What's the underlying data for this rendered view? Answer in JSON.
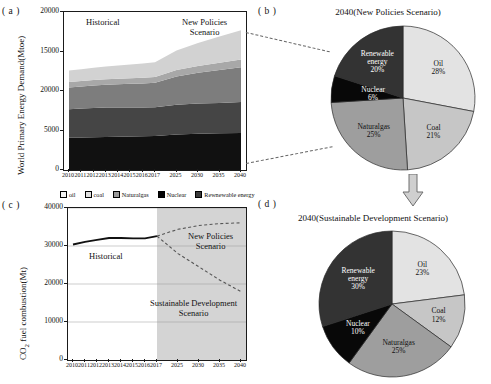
{
  "panels": {
    "a": {
      "label": "( a )"
    },
    "b": {
      "label": "( b )"
    },
    "c": {
      "label": "( c )"
    },
    "d": {
      "label": "( d )"
    }
  },
  "legend": {
    "items": [
      {
        "name": "oil",
        "label": "oil",
        "color": "#f2f2f2"
      },
      {
        "name": "coal",
        "label": "coal",
        "color": "#e0e0e0"
      },
      {
        "name": "naturalgas",
        "label": "Naturalgas",
        "color": "#9a9a9a"
      },
      {
        "name": "nuclear",
        "label": "Nuclear",
        "color": "#050505"
      },
      {
        "name": "renewable",
        "label": "Rewnewable energy",
        "color": "#3a3a3a"
      }
    ]
  },
  "chart_data": [
    {
      "panel": "a",
      "type": "area",
      "title": "",
      "xlabel": "",
      "ylabel": "World Primary Energy Demand(Mtoe)",
      "ylim": [
        0,
        20000
      ],
      "yticks": [
        0,
        5000,
        10000,
        15000,
        20000
      ],
      "ytick_labels": [
        "0",
        "5000",
        "20000",
        "15000",
        "20000"
      ],
      "x": [
        "2010",
        "2011",
        "2012",
        "2013",
        "2014",
        "2015",
        "2016",
        "2017",
        "2025",
        "2030",
        "2035",
        "2040"
      ],
      "grid": false,
      "annotations": [
        {
          "name": "historical-label",
          "text": "Historical"
        },
        {
          "name": "new-policies-label",
          "text": "New Policies\nScenario"
        }
      ],
      "series": [
        {
          "name": "Oil",
          "color": "#111111",
          "values": [
            4100,
            4120,
            4150,
            4180,
            4200,
            4230,
            4260,
            4300,
            4500,
            4600,
            4650,
            4700
          ]
        },
        {
          "name": "Coal",
          "color": "#454545",
          "values": [
            3600,
            3650,
            3700,
            3720,
            3700,
            3680,
            3650,
            3650,
            3750,
            3800,
            3850,
            3900
          ]
        },
        {
          "name": "Naturalgas",
          "color": "#7d7d7d",
          "values": [
            2750,
            2800,
            2850,
            2900,
            2950,
            3000,
            3050,
            3100,
            3600,
            3900,
            4150,
            4400
          ]
        },
        {
          "name": "Nuclear",
          "color": "#a8a8a8",
          "values": [
            700,
            690,
            680,
            690,
            700,
            700,
            710,
            720,
            820,
            880,
            930,
            980
          ]
        },
        {
          "name": "Renewable energy",
          "color": "#d2d2d2",
          "values": [
            1450,
            1500,
            1560,
            1620,
            1680,
            1740,
            1800,
            1880,
            2450,
            2900,
            3300,
            3700
          ]
        }
      ]
    },
    {
      "panel": "b",
      "type": "pie",
      "title": "2040(New Policies Scenario)",
      "labels": [
        "Oil",
        "Coal",
        "Naturalgas",
        "Nuclear",
        "Renewable\nenergy"
      ],
      "values": [
        28,
        21,
        25,
        6,
        20
      ],
      "value_labels": [
        "28%",
        "21%",
        "25%",
        "6%",
        "20%"
      ],
      "colors": [
        "#e3e3e3",
        "#c6c6c6",
        "#9e9e9e",
        "#080808",
        "#333333"
      ]
    },
    {
      "panel": "c",
      "type": "line",
      "title": "",
      "xlabel": "",
      "ylabel": "CO2 fuel combustion(Mt)",
      "ylabel_parts": {
        "pre": "CO",
        "sub": "2",
        "post": " fuel combustion(Mt)"
      },
      "ylim": [
        0,
        40000
      ],
      "yticks": [
        0,
        10000,
        20000,
        30000,
        40000
      ],
      "ytick_labels": [
        "0",
        "10000",
        "20000",
        "30000",
        "40000"
      ],
      "x": [
        "2010",
        "2011",
        "2012",
        "2013",
        "2014",
        "2015",
        "2016",
        "2017",
        "2025",
        "2030",
        "2035",
        "2040"
      ],
      "grid": true,
      "annotations": [
        {
          "name": "historical-label",
          "text": "Historical"
        },
        {
          "name": "new-policies-label",
          "text": "New Policies\nScenario"
        },
        {
          "name": "sustainable-development-label",
          "text": "Sustainable Development\nScenario"
        }
      ],
      "series": [
        {
          "name": "Historical",
          "style": "solid",
          "color": "#111111",
          "x": [
            "2010",
            "2011",
            "2012",
            "2013",
            "2014",
            "2015",
            "2016",
            "2017"
          ],
          "values": [
            30400,
            31100,
            31600,
            32100,
            32100,
            32000,
            32000,
            32600
          ]
        },
        {
          "name": "New Policies Scenario",
          "style": "dashed",
          "color": "#555555",
          "x": [
            "2017",
            "2025",
            "2030",
            "2035",
            "2040"
          ],
          "values": [
            32600,
            34400,
            35400,
            35900,
            36100
          ]
        },
        {
          "name": "Sustainable Development Scenario",
          "style": "dashed",
          "color": "#555555",
          "x": [
            "2017",
            "2025",
            "2030",
            "2035",
            "2040"
          ],
          "values": [
            32600,
            28000,
            24500,
            21000,
            18000
          ]
        }
      ]
    },
    {
      "panel": "d",
      "type": "pie",
      "title": "2040(Sustainable Development Scenario)",
      "labels": [
        "Oil",
        "Coal",
        "Naturalgas",
        "Nuclear",
        "Renewable\nenergy"
      ],
      "values": [
        23,
        12,
        25,
        10,
        30
      ],
      "value_labels": [
        "23%",
        "12%",
        "25%",
        "10%",
        "30%"
      ],
      "colors": [
        "#e3e3e3",
        "#c6c6c6",
        "#9e9e9e",
        "#080808",
        "#333333"
      ]
    }
  ]
}
